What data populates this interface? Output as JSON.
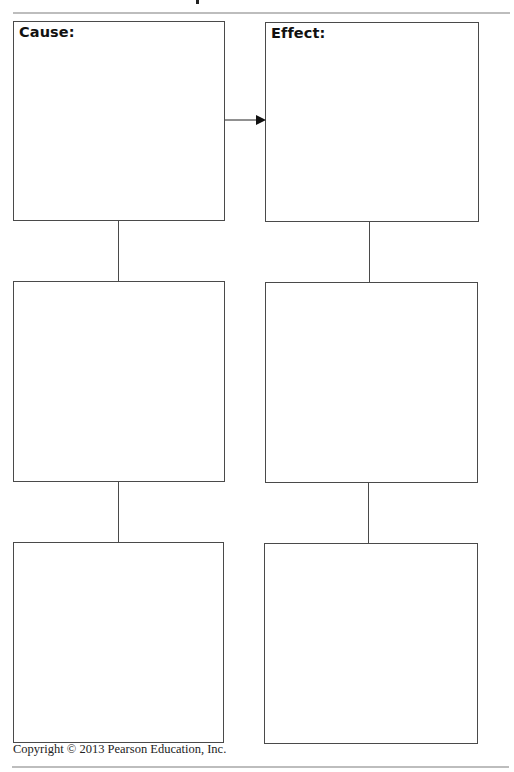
{
  "diagram": {
    "title_fragment": "p",
    "cause_label": "Cause:",
    "effect_label": "Effect:",
    "columns": [
      {
        "name": "cause",
        "boxes": 3
      },
      {
        "name": "effect",
        "boxes": 3
      }
    ],
    "arrow": {
      "from": "cause-box-1",
      "to": "effect-box-1"
    },
    "line_color": "#4a4a4a",
    "rule_color": "#bdbdbd"
  },
  "footer": {
    "copyright": "Copyright © 2013 Pearson Education, Inc."
  }
}
